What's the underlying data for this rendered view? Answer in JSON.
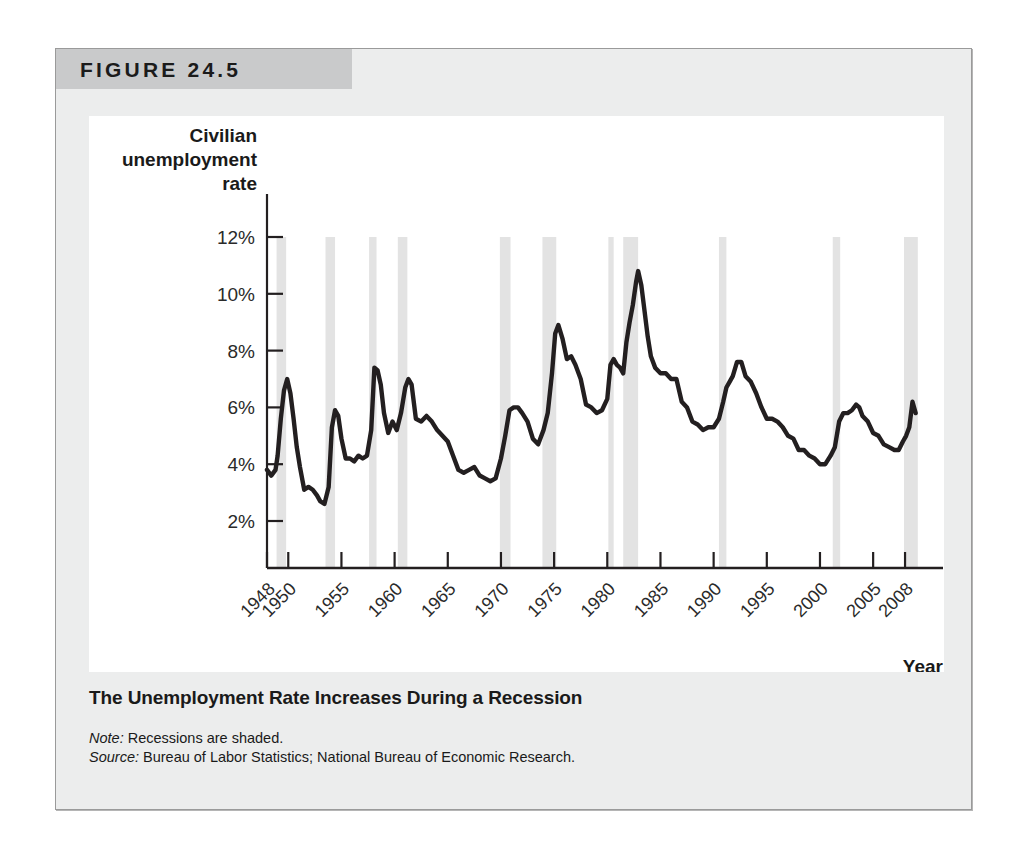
{
  "figure": {
    "label": "FIGURE 24.5",
    "caption_title": "The Unemployment Rate Increases During a Recession",
    "note_prefix": "Note:",
    "note_text": " Recessions are shaded.",
    "source_prefix": "Source:",
    "source_text": " Bureau of Labor Statistics; National Bureau of Economic Research."
  },
  "colors": {
    "banner": "#c9cacb",
    "panel_background": "#eceded",
    "plot_background": "#ffffff",
    "line": "#231f20",
    "recession_band": "#e3e3e3",
    "axis": "#231f20",
    "text": "#1a1a1a"
  },
  "chart_data": {
    "type": "line",
    "title": "",
    "xlabel": "Year",
    "ylabel": "Civilian unemployment rate",
    "ylabel_lines": [
      "Civilian",
      "unemployment",
      "rate"
    ],
    "xlim": [
      1948,
      2009.5
    ],
    "ylim": [
      0,
      13
    ],
    "grid": false,
    "legend": "none",
    "yticks": [
      2,
      4,
      6,
      8,
      10,
      12
    ],
    "ytick_labels": [
      "2%",
      "4%",
      "6%",
      "8%",
      "10%",
      "12%"
    ],
    "xticks": [
      1948,
      1950,
      1955,
      1960,
      1965,
      1970,
      1975,
      1980,
      1985,
      1990,
      1995,
      2000,
      2005,
      2008
    ],
    "xtick_labels": [
      "1948",
      "1950",
      "1955",
      "1960",
      "1965",
      "1970",
      "1975",
      "1980",
      "1985",
      "1990",
      "1995",
      "2000",
      "2005",
      "2008"
    ],
    "series": [
      {
        "name": "Civilian unemployment rate",
        "units": "percent",
        "x": [
          1948.0,
          1948.4,
          1948.8,
          1949.0,
          1949.3,
          1949.6,
          1949.9,
          1950.2,
          1950.5,
          1950.8,
          1951.1,
          1951.5,
          1951.9,
          1952.3,
          1952.7,
          1953.0,
          1953.4,
          1953.8,
          1954.1,
          1954.4,
          1954.7,
          1955.0,
          1955.4,
          1955.8,
          1956.2,
          1956.6,
          1957.0,
          1957.4,
          1957.8,
          1958.1,
          1958.4,
          1958.7,
          1959.0,
          1959.4,
          1959.8,
          1960.2,
          1960.6,
          1961.0,
          1961.3,
          1961.6,
          1962.0,
          1962.5,
          1963.0,
          1963.5,
          1964.0,
          1964.5,
          1965.0,
          1965.5,
          1966.0,
          1966.5,
          1967.0,
          1967.5,
          1968.0,
          1968.5,
          1969.0,
          1969.5,
          1970.0,
          1970.4,
          1970.8,
          1971.2,
          1971.6,
          1972.0,
          1972.5,
          1973.0,
          1973.5,
          1974.0,
          1974.4,
          1974.8,
          1975.1,
          1975.4,
          1975.8,
          1976.2,
          1976.6,
          1977.0,
          1977.5,
          1978.0,
          1978.5,
          1979.0,
          1979.5,
          1980.0,
          1980.3,
          1980.6,
          1980.9,
          1981.2,
          1981.5,
          1981.8,
          1982.1,
          1982.4,
          1982.7,
          1982.9,
          1983.2,
          1983.5,
          1983.8,
          1984.1,
          1984.5,
          1985.0,
          1985.5,
          1986.0,
          1986.5,
          1987.0,
          1987.5,
          1988.0,
          1988.5,
          1989.0,
          1989.5,
          1990.0,
          1990.5,
          1990.9,
          1991.2,
          1991.5,
          1991.8,
          1992.2,
          1992.6,
          1993.0,
          1993.5,
          1994.0,
          1994.5,
          1995.0,
          1995.5,
          1996.0,
          1996.5,
          1997.0,
          1997.5,
          1998.0,
          1998.5,
          1999.0,
          1999.5,
          2000.0,
          2000.5,
          2001.0,
          2001.4,
          2001.8,
          2002.2,
          2002.6,
          2003.0,
          2003.4,
          2003.7,
          2004.0,
          2004.5,
          2005.0,
          2005.5,
          2006.0,
          2006.5,
          2007.0,
          2007.4,
          2007.8,
          2008.1,
          2008.4,
          2008.7,
          2009.0
        ],
        "y": [
          3.8,
          3.6,
          3.8,
          4.3,
          5.6,
          6.6,
          7.0,
          6.5,
          5.6,
          4.6,
          3.9,
          3.1,
          3.2,
          3.1,
          2.9,
          2.7,
          2.6,
          3.2,
          5.3,
          5.9,
          5.7,
          4.9,
          4.2,
          4.2,
          4.1,
          4.3,
          4.2,
          4.3,
          5.2,
          7.4,
          7.3,
          6.8,
          5.8,
          5.1,
          5.5,
          5.2,
          5.8,
          6.7,
          7.0,
          6.8,
          5.6,
          5.5,
          5.7,
          5.5,
          5.2,
          5.0,
          4.8,
          4.3,
          3.8,
          3.7,
          3.8,
          3.9,
          3.6,
          3.5,
          3.4,
          3.5,
          4.2,
          5.0,
          5.9,
          6.0,
          6.0,
          5.8,
          5.5,
          4.9,
          4.7,
          5.2,
          5.8,
          7.2,
          8.6,
          8.9,
          8.4,
          7.7,
          7.8,
          7.5,
          7.0,
          6.1,
          6.0,
          5.8,
          5.9,
          6.3,
          7.5,
          7.7,
          7.5,
          7.4,
          7.2,
          8.3,
          9.0,
          9.6,
          10.4,
          10.8,
          10.3,
          9.4,
          8.5,
          7.8,
          7.4,
          7.2,
          7.2,
          7.0,
          7.0,
          6.2,
          6.0,
          5.5,
          5.4,
          5.2,
          5.3,
          5.3,
          5.6,
          6.2,
          6.7,
          6.9,
          7.1,
          7.6,
          7.6,
          7.1,
          6.9,
          6.5,
          6.0,
          5.6,
          5.6,
          5.5,
          5.3,
          5.0,
          4.9,
          4.5,
          4.5,
          4.3,
          4.2,
          4.0,
          4.0,
          4.3,
          4.6,
          5.5,
          5.8,
          5.8,
          5.9,
          6.1,
          6.0,
          5.7,
          5.5,
          5.1,
          5.0,
          4.7,
          4.6,
          4.5,
          4.5,
          4.8,
          5.0,
          5.3,
          6.2,
          5.8
        ]
      }
    ],
    "recessions": [
      {
        "label": "1948-49",
        "start": 1948.9,
        "end": 1949.8
      },
      {
        "label": "1953-54",
        "start": 1953.5,
        "end": 1954.4
      },
      {
        "label": "1957-58",
        "start": 1957.6,
        "end": 1958.3
      },
      {
        "label": "1960-61",
        "start": 1960.3,
        "end": 1961.2
      },
      {
        "label": "1969-70",
        "start": 1969.9,
        "end": 1970.9
      },
      {
        "label": "1973-75",
        "start": 1973.9,
        "end": 1975.2
      },
      {
        "label": "1980",
        "start": 1980.1,
        "end": 1980.6
      },
      {
        "label": "1981-82",
        "start": 1981.5,
        "end": 1982.9
      },
      {
        "label": "1990-91",
        "start": 1990.5,
        "end": 1991.2
      },
      {
        "label": "2001",
        "start": 2001.2,
        "end": 2001.9
      },
      {
        "label": "2007-09",
        "start": 2007.9,
        "end": 2009.2
      }
    ]
  }
}
